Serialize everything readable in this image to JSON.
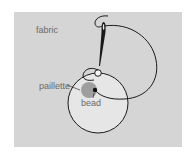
{
  "diagram": {
    "labels": {
      "fabric": "fabric",
      "paillette": "paillette",
      "bead": "bead"
    },
    "colors": {
      "background": "#ffffff",
      "panel": "#d5d5d5",
      "line": "#1a1a1a",
      "paillette_fill": "#ececec",
      "bead_shadow": "#9a9a9a",
      "label_text": "#6a6a6a"
    },
    "elements": [
      {
        "name": "fabric",
        "type": "background-panel"
      },
      {
        "name": "needle",
        "type": "icon"
      },
      {
        "name": "thread",
        "type": "curve"
      },
      {
        "name": "paillette",
        "type": "circle"
      },
      {
        "name": "bead",
        "type": "dot"
      }
    ]
  }
}
